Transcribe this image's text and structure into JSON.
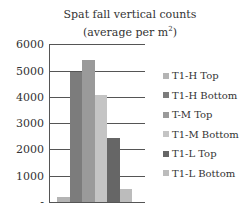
{
  "chart_data": {
    "type": "bar",
    "title": "Spat fall vertical counts",
    "subtitle": "(average per m²)",
    "xlabel": "",
    "ylabel": "",
    "ylim": [
      0,
      6000
    ],
    "yticks": [
      0,
      1000,
      2000,
      3000,
      4000,
      5000,
      6000
    ],
    "ytick_labels": [
      "-",
      "1000",
      "2000",
      "3000",
      "4000",
      "5000",
      "6000"
    ],
    "grid": true,
    "legend_position": "right",
    "categories": [
      "T1-H Top",
      "T1-H Bottom",
      "T-M Top",
      "T1-M Bottom",
      "T1-L Top",
      "T1-L Bottom"
    ],
    "values": [
      200,
      4950,
      5400,
      4080,
      2450,
      500
    ],
    "colors": [
      "#b4b4b4",
      "#7c7c7c",
      "#9a9a9a",
      "#c4c4c4",
      "#666666",
      "#bcbcbc"
    ]
  }
}
